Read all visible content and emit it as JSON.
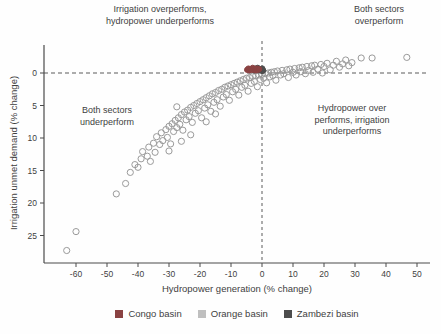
{
  "chart_data": {
    "type": "scatter",
    "xlabel": "Hydropower generation (% change)",
    "ylabel": "Irrigation unmet demand (% change)",
    "x_axis": {
      "ticks": [
        -60,
        -50,
        -40,
        -30,
        -20,
        -10,
        0,
        10,
        20,
        30,
        40,
        50
      ],
      "range": [
        -70,
        54
      ]
    },
    "y_axis": {
      "ticks": [
        0,
        5,
        10,
        15,
        20,
        25
      ],
      "range": [
        -4.3,
        29.2
      ],
      "inverted": true
    },
    "reference_lines": {
      "horizontal_at": 0,
      "vertical_at": 0,
      "style": "dashed"
    },
    "annotations": {
      "top_left": "Irrigation overperforms,\nhydropower underperforms",
      "top_right": "Both sectors\noverperform",
      "bottom_left": "Both sectors\nunderperform",
      "right": "Hydropower over\nperforms, irrigation\nunderperforms"
    },
    "series": [
      {
        "name": "Orange basin",
        "marker": "open-circle",
        "color": "#9a9a9a",
        "radius": 3.1,
        "points": [
          [
            -63,
            27.3
          ],
          [
            -60,
            24.4
          ],
          [
            -47,
            18.6
          ],
          [
            -44,
            17.0
          ],
          [
            -42.5,
            15.3
          ],
          [
            -41,
            14.1
          ],
          [
            -40,
            14.5
          ],
          [
            -39,
            13.2
          ],
          [
            -38.5,
            12.1
          ],
          [
            -37,
            12.8
          ],
          [
            -36.5,
            11.4
          ],
          [
            -36,
            13.6
          ],
          [
            -35,
            10.8
          ],
          [
            -34.5,
            12.2
          ],
          [
            -34,
            9.8
          ],
          [
            -33,
            11.0
          ],
          [
            -32.5,
            9.2
          ],
          [
            -32,
            10.4
          ],
          [
            -31,
            8.7
          ],
          [
            -30.5,
            9.9
          ],
          [
            -30,
            12.0
          ],
          [
            -30,
            8.2
          ],
          [
            -29.5,
            10.9
          ],
          [
            -29,
            7.8
          ],
          [
            -28.5,
            9.0
          ],
          [
            -28,
            7.3
          ],
          [
            -27.5,
            5.2
          ],
          [
            -27.5,
            8.4
          ],
          [
            -27,
            6.9
          ],
          [
            -26.5,
            7.9
          ],
          [
            -26,
            10.5
          ],
          [
            -26,
            6.4
          ],
          [
            -25.5,
            8.8
          ],
          [
            -25,
            6.0
          ],
          [
            -24.5,
            7.2
          ],
          [
            -24,
            5.7
          ],
          [
            -23.5,
            6.7
          ],
          [
            -23,
            9.5
          ],
          [
            -23,
            5.3
          ],
          [
            -22.5,
            7.6
          ],
          [
            -22,
            5.0
          ],
          [
            -21.5,
            6.2
          ],
          [
            -21,
            4.7
          ],
          [
            -20.5,
            5.8
          ],
          [
            -20,
            4.4
          ],
          [
            -19.5,
            6.9
          ],
          [
            -19,
            4.1
          ],
          [
            -18.5,
            5.4
          ],
          [
            -18,
            7.5
          ],
          [
            -18,
            3.8
          ],
          [
            -17.5,
            4.9
          ],
          [
            -17,
            3.5
          ],
          [
            -16.5,
            5.9
          ],
          [
            -16,
            3.2
          ],
          [
            -15.5,
            4.5
          ],
          [
            -15,
            6.3
          ],
          [
            -15,
            3.0
          ],
          [
            -14.5,
            4.1
          ],
          [
            -14,
            2.7
          ],
          [
            -13.5,
            5.1
          ],
          [
            -13,
            2.5
          ],
          [
            -12.5,
            3.7
          ],
          [
            -12,
            2.2
          ],
          [
            -11.5,
            3.3
          ],
          [
            -11,
            2.0
          ],
          [
            -10.5,
            4.2
          ],
          [
            -10,
            1.8
          ],
          [
            -9.5,
            2.9
          ],
          [
            -9,
            1.6
          ],
          [
            -8.5,
            2.5
          ],
          [
            -8,
            1.4
          ],
          [
            -7.5,
            3.4
          ],
          [
            -7,
            1.2
          ],
          [
            -6.5,
            2.2
          ],
          [
            -6,
            1.0
          ],
          [
            -5.5,
            1.9
          ],
          [
            -5,
            0.8
          ],
          [
            -4.5,
            2.8
          ],
          [
            -4,
            0.7
          ],
          [
            -3.5,
            1.6
          ],
          [
            -3,
            0.5
          ],
          [
            -2.5,
            1.3
          ],
          [
            -2,
            0.4
          ],
          [
            -1.5,
            2.1
          ],
          [
            -1,
            0.3
          ],
          [
            -0.5,
            1.0
          ],
          [
            0,
            0.2
          ],
          [
            0.5,
            0.8
          ],
          [
            1,
            0.1
          ],
          [
            1.5,
            1.5
          ],
          [
            2,
            0
          ],
          [
            2.5,
            0.6
          ],
          [
            3,
            -0.1
          ],
          [
            3.5,
            0.4
          ],
          [
            4,
            -0.2
          ],
          [
            4.5,
            1.1
          ],
          [
            5,
            -0.3
          ],
          [
            6,
            0.3
          ],
          [
            6.5,
            -0.4
          ],
          [
            7,
            0.1
          ],
          [
            8,
            -0.5
          ],
          [
            8.5,
            0.7
          ],
          [
            9,
            -0.6
          ],
          [
            10,
            -0.1
          ],
          [
            10.5,
            -0.7
          ],
          [
            11,
            0.3
          ],
          [
            12,
            -0.8
          ],
          [
            12.5,
            -0.2
          ],
          [
            13,
            -0.9
          ],
          [
            14,
            0.1
          ],
          [
            14.5,
            -1.0
          ],
          [
            15,
            -0.4
          ],
          [
            16,
            -1.1
          ],
          [
            16.5,
            -0.1
          ],
          [
            17,
            -1.2
          ],
          [
            18,
            -0.6
          ],
          [
            19,
            -1.3
          ],
          [
            19.5,
            0
          ],
          [
            20,
            -1.0
          ],
          [
            21,
            -1.5
          ],
          [
            22,
            -0.5
          ],
          [
            23,
            -1.2
          ],
          [
            24,
            -1.8
          ],
          [
            25,
            -0.9
          ],
          [
            26,
            -1.4
          ],
          [
            27,
            -2.0
          ],
          [
            28,
            -1.1
          ],
          [
            29,
            -1.6
          ],
          [
            32,
            -2.3
          ],
          [
            35.5,
            -2.3
          ],
          [
            46.7,
            -2.4
          ]
        ]
      },
      {
        "name": "Zambezi basin",
        "marker": "filled-circle",
        "color": "#4d4d4d",
        "radius": 2.6,
        "points": [
          [
            -2.5,
            -0.4
          ],
          [
            -2.1,
            -0.7
          ],
          [
            -1.8,
            -0.5
          ],
          [
            -1.4,
            -0.8
          ],
          [
            -1.1,
            -0.4
          ],
          [
            -0.7,
            -0.6
          ],
          [
            -0.3,
            -0.5
          ],
          [
            0.1,
            -0.7
          ],
          [
            0.4,
            -0.4
          ],
          [
            0.0,
            -0.3
          ]
        ]
      },
      {
        "name": "Congo basin",
        "marker": "filled-circle",
        "color": "#8a4242",
        "radius": 2.6,
        "points": [
          [
            -4.8,
            -0.5
          ],
          [
            -4.4,
            -0.7
          ],
          [
            -4.1,
            -0.4
          ],
          [
            -3.7,
            -0.6
          ],
          [
            -3.4,
            -0.5
          ],
          [
            -3.0,
            -0.8
          ],
          [
            -2.7,
            -0.5
          ],
          [
            -2.3,
            -0.6
          ],
          [
            -2.0,
            -0.4
          ],
          [
            -1.6,
            -0.7
          ],
          [
            -1.3,
            -0.5
          ],
          [
            -0.9,
            -0.6
          ]
        ]
      }
    ],
    "legend": [
      {
        "label": "Congo basin",
        "color": "#8a4242"
      },
      {
        "label": "Orange basin",
        "color": "#bfbfbf"
      },
      {
        "label": "Zambezi basin",
        "color": "#4d4d4d"
      }
    ],
    "legend_position": "bottom-center",
    "grid": false,
    "colors": {
      "axis": "#4a4a4a",
      "dashed_line": "#5a5a5a",
      "text": "#3f3f3f"
    }
  }
}
